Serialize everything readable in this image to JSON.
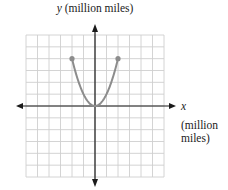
{
  "chart_data": {
    "type": "line",
    "title": "",
    "xlabel": "x (million miles)",
    "ylabel": "y (million miles)",
    "xlim": [
      -6,
      6
    ],
    "ylim": [
      -6,
      6
    ],
    "grid": true,
    "grid_step": 1,
    "tick_labels": false,
    "series": [
      {
        "name": "parabola",
        "equation": "y = x^2",
        "x": [
          -2,
          -1.5,
          -1,
          -0.5,
          0,
          0.5,
          1,
          1.5,
          2
        ],
        "y": [
          4,
          2.25,
          1,
          0.25,
          0,
          0.25,
          1,
          2.25,
          4
        ],
        "endpoints": [
          [
            -2,
            4
          ],
          [
            2,
            4
          ]
        ],
        "color": "#8c8c8c"
      }
    ],
    "colors": {
      "grid": "#cfcfcf",
      "axis": "#1a1a1a",
      "curve": "#8c8c8c"
    }
  },
  "labels": {
    "y_var": "y",
    "y_unit": "(million miles)",
    "x_var": "x",
    "x_unit_line1": "(million",
    "x_unit_line2": "miles)"
  }
}
